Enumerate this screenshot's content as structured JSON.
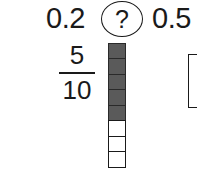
{
  "comparison": {
    "left_value": "0.2",
    "operator_placeholder": "?",
    "right_value": "0.5"
  },
  "fraction": {
    "numerator": "5",
    "denominator": "10"
  },
  "tenths_strip": {
    "visible_cells": 8,
    "shaded_cells": 5,
    "cells": [
      "shaded",
      "shaded",
      "shaded",
      "shaded",
      "shaded",
      "empty",
      "empty",
      "empty"
    ],
    "shade_color": "#5a5a5a"
  }
}
